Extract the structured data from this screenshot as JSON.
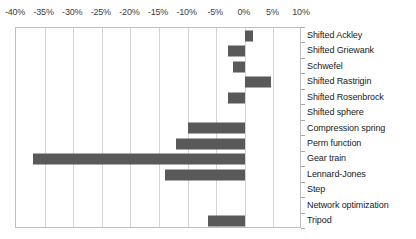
{
  "chart_data": {
    "type": "bar",
    "orientation": "horizontal",
    "title": "",
    "xlabel": "",
    "ylabel": "",
    "xlim": [
      -40,
      10
    ],
    "xticks": [
      -40,
      -35,
      -30,
      -25,
      -20,
      -15,
      -10,
      -5,
      0,
      5,
      10
    ],
    "xtick_labels": [
      "-40%",
      "-35%",
      "-30%",
      "-25%",
      "-20%",
      "-15%",
      "-10%",
      "-5%",
      "0%",
      "5%",
      "10%"
    ],
    "grid": true,
    "legend": "none",
    "value_unit": "percent",
    "categories": [
      "Shifted Ackley",
      "Shifted Griewank",
      "Schwefel",
      "Shifted Rastrigin",
      "Shifted Rosenbrock",
      "Shifted sphere",
      "Compression spring",
      "Perm function",
      "Gear train",
      "Lennard-Jones",
      "Step",
      "Network optimization",
      "Tripod"
    ],
    "values": [
      1.5,
      -3,
      -2,
      4.5,
      -3,
      0,
      -10,
      -12,
      -37,
      -14,
      0,
      0,
      -6.5
    ]
  },
  "colors": {
    "bar_fill": "#595959",
    "gridline": "#d4d4d4",
    "plot_border": "#bfbfbf",
    "tick_text": "#404040",
    "label_text": "#1a1a1a",
    "background": "#ffffff"
  }
}
